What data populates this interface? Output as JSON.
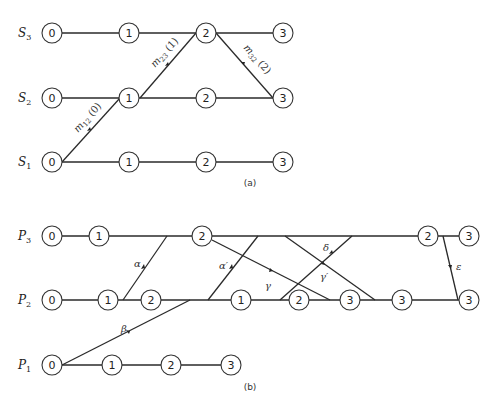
{
  "figure_a": {
    "caption": "(a)",
    "rows": [
      {
        "label": "S",
        "sub": "3",
        "y": 33,
        "nodes": [
          {
            "x": 52,
            "t": "0"
          },
          {
            "x": 129,
            "t": "1"
          },
          {
            "x": 206,
            "t": "2"
          },
          {
            "x": 283,
            "t": "3"
          }
        ]
      },
      {
        "label": "S",
        "sub": "2",
        "y": 98,
        "nodes": [
          {
            "x": 52,
            "t": "0"
          },
          {
            "x": 129,
            "t": "1"
          },
          {
            "x": 206,
            "t": "2"
          },
          {
            "x": 283,
            "t": "3"
          }
        ]
      },
      {
        "label": "S",
        "sub": "1",
        "y": 162,
        "nodes": [
          {
            "x": 52,
            "t": "0"
          },
          {
            "x": 129,
            "t": "1"
          },
          {
            "x": 206,
            "t": "2"
          },
          {
            "x": 283,
            "t": "3"
          }
        ]
      }
    ],
    "messages": [
      {
        "label": "m12 (0)",
        "text": "m",
        "sub": "12",
        "suffix": " (0)"
      },
      {
        "label": "m23 (1)",
        "text": "m",
        "sub": "23",
        "suffix": " (1)"
      },
      {
        "label": "m32 (2)",
        "text": "m",
        "sub": "32",
        "suffix": " (2)"
      }
    ]
  },
  "figure_b": {
    "caption": "(b)",
    "rows": [
      {
        "label": "P",
        "sub": "3",
        "y": 236
      },
      {
        "label": "P",
        "sub": "2",
        "y": 300
      },
      {
        "label": "P",
        "sub": "1",
        "y": 365
      }
    ],
    "messages": [
      "α",
      "β",
      "α′",
      "γ",
      "γ′",
      "δ",
      "ε"
    ]
  }
}
